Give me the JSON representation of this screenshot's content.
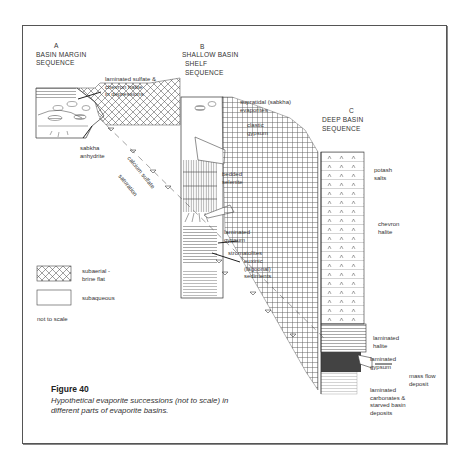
{
  "figure": {
    "title": "Figure 40",
    "caption": "Hypothetical evaporite successions (not to scale) in different parts of evaporite basins."
  },
  "columns": {
    "a": {
      "letter": "A",
      "line1": "BASIN MARGIN",
      "line2": "SEQUENCE"
    },
    "b": {
      "letter": "B",
      "line1": "SHALLOW BASIN",
      "line2": "SHELF",
      "line3": "SEQUENCE"
    },
    "c": {
      "letter": "C",
      "line1": "DEEP BASIN",
      "line2": "SEQUENCE"
    }
  },
  "labels": {
    "laminated_sulfate": "laminated sulfate &\nchevron halite\nin depressions",
    "sabkha_anhydrite": "sabkha\nanhydrite",
    "supratidal": "supratidal (sabkha)\nevaporites",
    "clastic_gypsum": "clastic\ngypsum",
    "bedded_selenite": "bedded\nselenite",
    "laminated_gypsum_b": "laminated\ngypsum",
    "stromatolites": "stromatolites",
    "euxinic": "euxinic\n(lagoonal)\nsediments",
    "calcium_sulfate": "calcium sulfate",
    "saturation": "saturation",
    "potash_salts": "potash\nsalts",
    "chevron_halite": "chevron\nhalite",
    "laminated_halite": "laminated\nhalite",
    "laminated_gypsum_c": "laminated\ngypsum",
    "mass_flow": "mass flow\ndeposit",
    "laminated_carbonates": "laminated\ncarbonates &\nstarved basin\ndeposits"
  },
  "legend": {
    "items": [
      {
        "pattern": "crosshatch",
        "label": "subaerial -\nbrine flat"
      },
      {
        "pattern": "blank",
        "label": "subaqueous"
      }
    ],
    "note": "not to scale"
  }
}
